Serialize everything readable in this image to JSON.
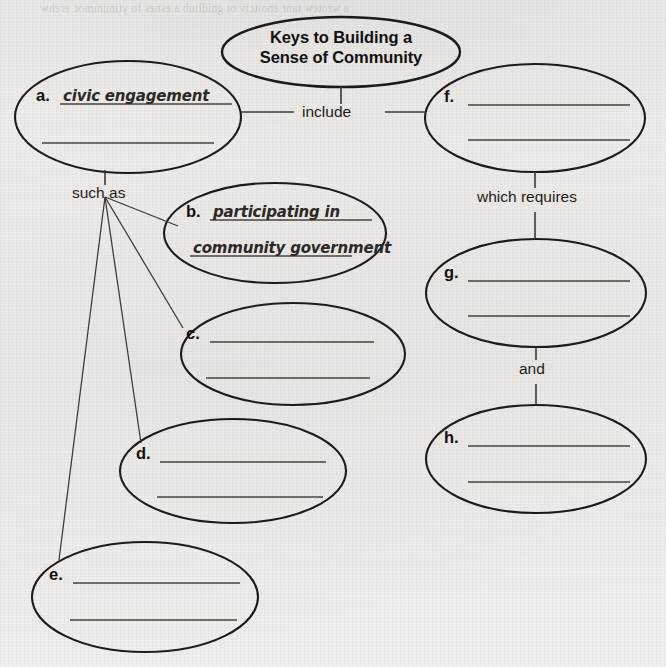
{
  "document": {
    "type": "graphic-organizer",
    "title_line_1": "Keys to Building a",
    "title_line_2": "Sense of Community"
  },
  "colors": {
    "paper": "#efeeeb",
    "ink": "#1c1b1a",
    "connector": "#3a3936",
    "rule": "#45443f",
    "answer_ink": "#2a2927"
  },
  "connector_labels": {
    "include": "include",
    "such_as": "such as",
    "which_requires": "which requires",
    "and": "and"
  },
  "nodes": [
    {
      "id": "a",
      "letter": "a.",
      "line1": "civic engagement",
      "line2": "",
      "filled": true
    },
    {
      "id": "b",
      "letter": "b.",
      "line1": "participating in",
      "line2": "community government",
      "filled": true
    },
    {
      "id": "c",
      "letter": "c.",
      "line1": "",
      "line2": "",
      "filled": false
    },
    {
      "id": "d",
      "letter": "d.",
      "line1": "",
      "line2": "",
      "filled": false
    },
    {
      "id": "e",
      "letter": "e.",
      "line1": "",
      "line2": "",
      "filled": false
    },
    {
      "id": "f",
      "letter": "f.",
      "line1": "",
      "line2": "",
      "filled": false
    },
    {
      "id": "g",
      "letter": "g.",
      "line1": "",
      "line2": "",
      "filled": false
    },
    {
      "id": "h",
      "letter": "h.",
      "line1": "",
      "line2": "",
      "filled": false
    }
  ]
}
